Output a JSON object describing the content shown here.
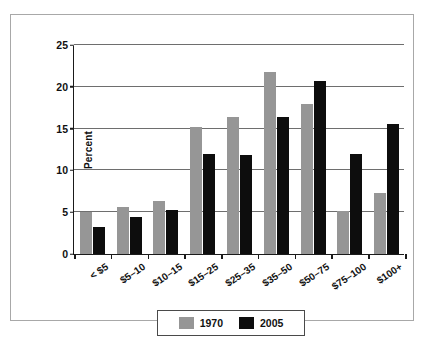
{
  "figure": {
    "frame_border_color": "#a8a8a8",
    "background": "#ffffff"
  },
  "chart_data": {
    "type": "bar",
    "title": "",
    "subtitle": "",
    "xlabel": "",
    "ylabel": "Percent",
    "ylim": [
      0,
      25
    ],
    "yticks": [
      0,
      5,
      10,
      15,
      20,
      25
    ],
    "ytick_labels": [
      "0",
      "5",
      "10",
      "15",
      "20",
      "25"
    ],
    "grid": true,
    "grid_axis": "y",
    "legend_position": "bottom-center",
    "categories": [
      "< $5",
      "$5–10",
      "$10–15",
      "$15–25",
      "$25–35",
      "$35–50",
      "$50–75",
      "$75–100",
      "$100+"
    ],
    "series": [
      {
        "name": "1970",
        "color": "#969696",
        "values": [
          5.0,
          5.6,
          6.4,
          15.2,
          16.4,
          21.8,
          17.9,
          5.2,
          7.3
        ]
      },
      {
        "name": "2005",
        "color": "#0d0d0d",
        "values": [
          3.2,
          4.4,
          5.3,
          12.0,
          11.8,
          16.4,
          20.7,
          12.0,
          15.5
        ]
      }
    ]
  },
  "legend": {
    "entries": [
      {
        "label": "1970",
        "color": "#969696"
      },
      {
        "label": "2005",
        "color": "#0d0d0d"
      }
    ]
  }
}
